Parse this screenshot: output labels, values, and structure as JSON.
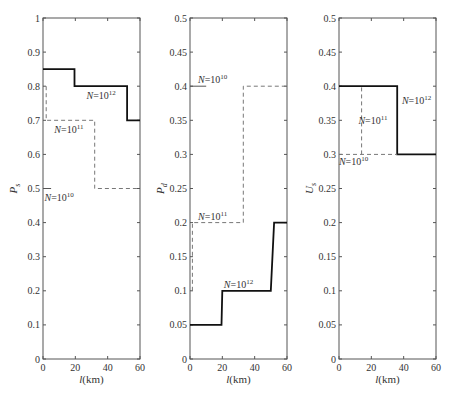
{
  "chart_data": [
    {
      "type": "line",
      "title": "",
      "xlabel": "l(km)",
      "ylabel": "P_s",
      "xlim": [
        0,
        60
      ],
      "ylim": [
        0,
        1
      ],
      "xticks": [
        0,
        20,
        40,
        60
      ],
      "yticks": [
        0,
        0.1,
        0.2,
        0.3,
        0.4,
        0.5,
        0.6,
        0.7,
        0.8,
        0.9,
        1
      ],
      "ytick_labels": [
        "0",
        "0.1",
        "0.2",
        "0.3",
        "0.4",
        "0.5",
        "0.6",
        "0.7",
        "0.8",
        "0.9",
        "1"
      ],
      "grid": false,
      "series": [
        {
          "name": "N=10^12",
          "style": "solid",
          "x": [
            0,
            19.5,
            19.5,
            52,
            52,
            60
          ],
          "y": [
            0.85,
            0.85,
            0.8,
            0.8,
            0.7,
            0.7
          ]
        },
        {
          "name": "N=10^11",
          "style": "dashed",
          "x": [
            2,
            2,
            32,
            32,
            60
          ],
          "y": [
            0.8,
            0.7,
            0.7,
            0.5,
            0.5
          ]
        },
        {
          "name": "N=10^10",
          "style": "solid",
          "x": [
            0,
            5
          ],
          "y": [
            0.5,
            0.5
          ]
        }
      ],
      "annotations": [
        {
          "text": "N=10^12",
          "x": 36,
          "y": 0.775
        },
        {
          "text": "N=10^11",
          "x": 16,
          "y": 0.675
        },
        {
          "text": "N=10^10",
          "x": 10,
          "y": 0.475
        }
      ]
    },
    {
      "type": "line",
      "title": "",
      "xlabel": "l(km)",
      "ylabel": "P_d",
      "xlim": [
        0,
        60
      ],
      "ylim": [
        0,
        0.5
      ],
      "xticks": [
        0,
        20,
        40,
        60
      ],
      "yticks": [
        0,
        0.05,
        0.1,
        0.15,
        0.2,
        0.25,
        0.3,
        0.35,
        0.4,
        0.45,
        0.5
      ],
      "ytick_labels": [
        "0",
        "0.05",
        "0.1",
        "0.15",
        "0.2",
        "0.25",
        "0.3",
        "0.35",
        "0.4",
        "0.45",
        "0.5"
      ],
      "grid": false,
      "series": [
        {
          "name": "N=10^12",
          "style": "solid",
          "x": [
            0,
            19.5,
            20,
            50,
            52,
            60
          ],
          "y": [
            0.05,
            0.05,
            0.1,
            0.1,
            0.2,
            0.2
          ]
        },
        {
          "name": "N=10^11",
          "style": "dashed",
          "x": [
            1.5,
            1.5,
            33,
            33,
            60
          ],
          "y": [
            0.1,
            0.2,
            0.2,
            0.4,
            0.4
          ]
        },
        {
          "name": "N=10^10",
          "style": "solid",
          "x": [
            0,
            10
          ],
          "y": [
            0.4,
            0.4
          ]
        }
      ],
      "annotations": [
        {
          "text": "N=10^10",
          "x": 14,
          "y": 0.41
        },
        {
          "text": "N=10^11",
          "x": 14,
          "y": 0.21
        },
        {
          "text": "N=10^12",
          "x": 30,
          "y": 0.11
        }
      ]
    },
    {
      "type": "line",
      "title": "",
      "xlabel": "l(km)",
      "ylabel": "U_s",
      "xlim": [
        0,
        60
      ],
      "ylim": [
        0,
        0.5
      ],
      "xticks": [
        0,
        20,
        40,
        60
      ],
      "yticks": [
        0,
        0.05,
        0.1,
        0.15,
        0.2,
        0.25,
        0.3,
        0.35,
        0.4,
        0.45,
        0.5
      ],
      "ytick_labels": [
        "0",
        "0.05",
        "0.1",
        "0.15",
        "0.2",
        "0.25",
        "0.3",
        "0.35",
        "0.4",
        "0.45",
        "0.5"
      ],
      "grid": false,
      "series": [
        {
          "name": "N=10^12",
          "style": "solid",
          "x": [
            0,
            36,
            36,
            60
          ],
          "y": [
            0.4,
            0.4,
            0.3,
            0.3
          ]
        },
        {
          "name": "N=10^11",
          "style": "dashed",
          "x": [
            14,
            14
          ],
          "y": [
            0.3,
            0.4
          ]
        },
        {
          "name": "N=10^10",
          "style": "dashed",
          "x": [
            0,
            36
          ],
          "y": [
            0.3,
            0.3
          ]
        }
      ],
      "annotations": [
        {
          "text": "N=10^12",
          "x": 48,
          "y": 0.38
        },
        {
          "text": "N=10^11",
          "x": 21,
          "y": 0.35
        },
        {
          "text": "N=10^10",
          "x": 9,
          "y": 0.29
        }
      ]
    }
  ],
  "figure": {
    "panels": [
      {
        "ylabel_main": "P",
        "ylabel_sub": "s",
        "xlabel_italic": "l",
        "xlabel_rest": "(km)"
      },
      {
        "ylabel_main": "P",
        "ylabel_sub": "d",
        "xlabel_italic": "l",
        "xlabel_rest": "(km)"
      },
      {
        "ylabel_main": "U",
        "ylabel_sub": "s",
        "xlabel_italic": "l",
        "xlabel_rest": "(km)"
      }
    ]
  }
}
